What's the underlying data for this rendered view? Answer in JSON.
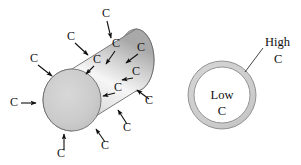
{
  "figure": {
    "background_color": "#ffffff",
    "width": 301,
    "height": 165
  },
  "cylinder": {
    "name": "steel cylinder",
    "front_face_fill": "#c9c9c9",
    "body_highlight": "#f2f2f2",
    "body_shadow": "#a8a8a8",
    "outline_color": "#6e6e6e",
    "carbon_label": "C",
    "arrow_color": "#101010",
    "carbon_arrows": [
      {
        "id": "top-1",
        "label": "C",
        "label_x": 106,
        "label_y": 17,
        "tail_x": 107,
        "tail_y": 21,
        "tip_x": 111,
        "tip_y": 38
      },
      {
        "id": "upper-left-1",
        "label": "C",
        "label_x": 71,
        "label_y": 40,
        "tail_x": 75,
        "tail_y": 43,
        "tip_x": 88,
        "tip_y": 55
      },
      {
        "id": "left-upper",
        "label": "C",
        "label_x": 34,
        "label_y": 62,
        "tail_x": 38,
        "tail_y": 65,
        "tip_x": 52,
        "tip_y": 76
      },
      {
        "id": "left-mid",
        "label": "C",
        "label_x": 14,
        "label_y": 106,
        "tail_x": 21,
        "tail_y": 103,
        "tip_x": 36,
        "tip_y": 103
      },
      {
        "id": "bottom-left",
        "label": "C",
        "label_x": 61,
        "label_y": 157,
        "tail_x": 64,
        "tail_y": 150,
        "tip_x": 64,
        "tip_y": 134
      },
      {
        "id": "bottom-right",
        "label": "C",
        "label_x": 105,
        "label_y": 149,
        "tail_x": 105,
        "tail_y": 142,
        "tip_x": 96,
        "tip_y": 129
      },
      {
        "id": "lower-right-1",
        "label": "C",
        "label_x": 127,
        "label_y": 131,
        "tail_x": 127,
        "tail_y": 124,
        "tip_x": 118,
        "tip_y": 110
      },
      {
        "id": "right-lower",
        "label": "C",
        "label_x": 149,
        "label_y": 104,
        "tail_x": 149,
        "tail_y": 99,
        "tip_x": 137,
        "tip_y": 90
      },
      {
        "id": "right-upper",
        "label": "C",
        "label_x": 141,
        "label_y": 51,
        "tail_x": 138,
        "tail_y": 54,
        "tip_x": 126,
        "tip_y": 63
      },
      {
        "id": "surface-in-1",
        "label": "C",
        "label_x": 116,
        "label_y": 47,
        "tail_x": 115,
        "tail_y": 51,
        "tip_x": 106,
        "tip_y": 64
      },
      {
        "id": "surface-in-2",
        "label": "C",
        "label_x": 97,
        "label_y": 63,
        "tail_x": 94,
        "tail_y": 66,
        "tip_x": 86,
        "tip_y": 74
      },
      {
        "id": "surface-in-3",
        "label": "C",
        "label_x": 136,
        "label_y": 75,
        "tail_x": 133,
        "tail_y": 78,
        "tip_x": 122,
        "tip_y": 80
      },
      {
        "id": "surface-in-4",
        "label": "C",
        "label_x": 118,
        "label_y": 91,
        "tail_x": 115,
        "tail_y": 93,
        "tip_x": 103,
        "tip_y": 96
      }
    ]
  },
  "cross_section": {
    "name": "cylinder cross section",
    "case_ring_fill": "#cfcfcf",
    "core_fill": "#ffffff",
    "outline_color": "#8a8a8a",
    "core_label_line1": "Low",
    "core_label_line2": "C",
    "case_label_line1": "High",
    "case_label_line2": "C",
    "leader_color": "#303030",
    "center_x": 222,
    "center_y": 95,
    "outer_radius": 34,
    "inner_radius": 28
  }
}
